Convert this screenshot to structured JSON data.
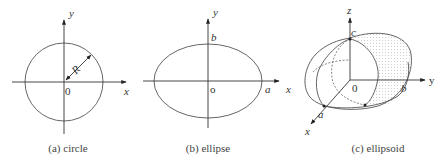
{
  "figure": {
    "panels": [
      {
        "id": "a",
        "caption": "(a) circle",
        "shape": "circle",
        "labels": {
          "x_axis": "x",
          "y_axis": "y",
          "origin": "0",
          "radius": "R"
        }
      },
      {
        "id": "b",
        "caption": "(b) ellipse",
        "shape": "ellipse",
        "labels": {
          "x_axis": "x",
          "y_axis": "y",
          "origin": "o",
          "semi_major": "a",
          "semi_minor": "b"
        }
      },
      {
        "id": "c",
        "caption": "(c) ellipsoid",
        "shape": "ellipsoid",
        "labels": {
          "x_axis": "x",
          "y_axis": "y",
          "z_axis": "z",
          "origin": "0",
          "semi_axis_x": "a",
          "semi_axis_y": "b",
          "semi_axis_z": "c"
        }
      }
    ],
    "colors": {
      "line": "#555555",
      "axis": "#333333",
      "text": "#333333",
      "shading": "#9a9a9a"
    }
  }
}
